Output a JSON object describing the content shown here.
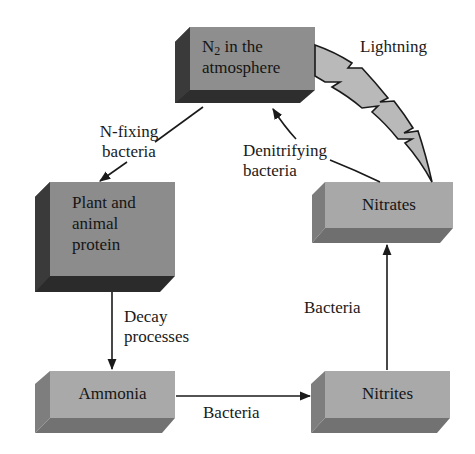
{
  "colors": {
    "box_front_dark": "#8c8c8c",
    "box_side_dark": "#3a3a3a",
    "box_front_light": "#a9a9a9",
    "box_side_light": "#7a7a7a",
    "lightning_fill": "#b9b9b9",
    "line": "#1a1a1a"
  },
  "nodes": {
    "n2": {
      "prefix": "N",
      "subscript": "2",
      "line1_rest": " in the",
      "line2": "atmosphere"
    },
    "protein": {
      "line1": "Plant and",
      "line2": "animal",
      "line3": "protein"
    },
    "ammonia": {
      "label": "Ammonia"
    },
    "nitrites": {
      "label": "Nitrites"
    },
    "nitrates": {
      "label": "Nitrates"
    }
  },
  "edges": {
    "n_fixing": {
      "line1": "N-fixing",
      "line2": "bacteria",
      "from": "n2",
      "to": "protein"
    },
    "decay": {
      "line1": "Decay",
      "line2": "processes",
      "from": "protein",
      "to": "ammonia"
    },
    "ammonia_to_nitrites": {
      "label": "Bacteria",
      "from": "ammonia",
      "to": "nitrites"
    },
    "nitrites_to_nitrates": {
      "label": "Bacteria",
      "from": "nitrites",
      "to": "nitrates"
    },
    "denitrifying": {
      "line1": "Denitrifying",
      "line2": "bacteria",
      "from": "nitrates",
      "to": "n2"
    },
    "lightning": {
      "label": "Lightning",
      "from": "n2",
      "to": "nitrates"
    }
  }
}
